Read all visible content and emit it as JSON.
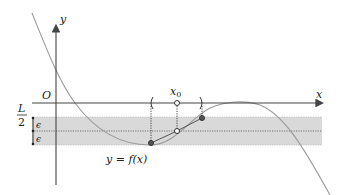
{
  "diagram": {
    "title": "",
    "axes": {
      "x_label": "x",
      "y_label": "y",
      "origin_label": "O"
    },
    "labels": {
      "x0": "x",
      "x0_sub": "0",
      "curve": "y = f(x)",
      "L_num": "L",
      "L_den": "2",
      "epsilon_top": "ϵ",
      "epsilon_bottom": "ϵ"
    },
    "colors": {
      "axis": "#555555",
      "curve": "#9a9a9a",
      "band": "#d9d9d9",
      "points": "#555555",
      "text": "#222222"
    },
    "elements": {
      "band": "Horizontal gray band of height 2ϵ centered at y = L/2",
      "neighborhood": "Open interval around x0 marked with parentheses on x-axis",
      "points": [
        "filled point at left bracket",
        "open point at x0",
        "filled point at right bracket"
      ]
    }
  }
}
